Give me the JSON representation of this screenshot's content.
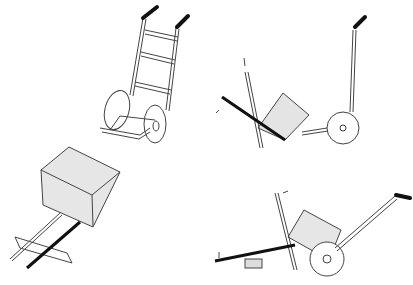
{
  "figure": {
    "panels": [
      {
        "id": "hand-truck-upright",
        "position": "top-left"
      },
      {
        "id": "lever-tilting-box",
        "position": "top-right"
      },
      {
        "id": "box-on-skids",
        "position": "bottom-left"
      },
      {
        "id": "loading-with-lever",
        "position": "bottom-right"
      }
    ],
    "colors": {
      "stroke": "#444444",
      "box_fill": "#e4e4e4",
      "grip": "#111111",
      "background": "#ffffff"
    }
  }
}
